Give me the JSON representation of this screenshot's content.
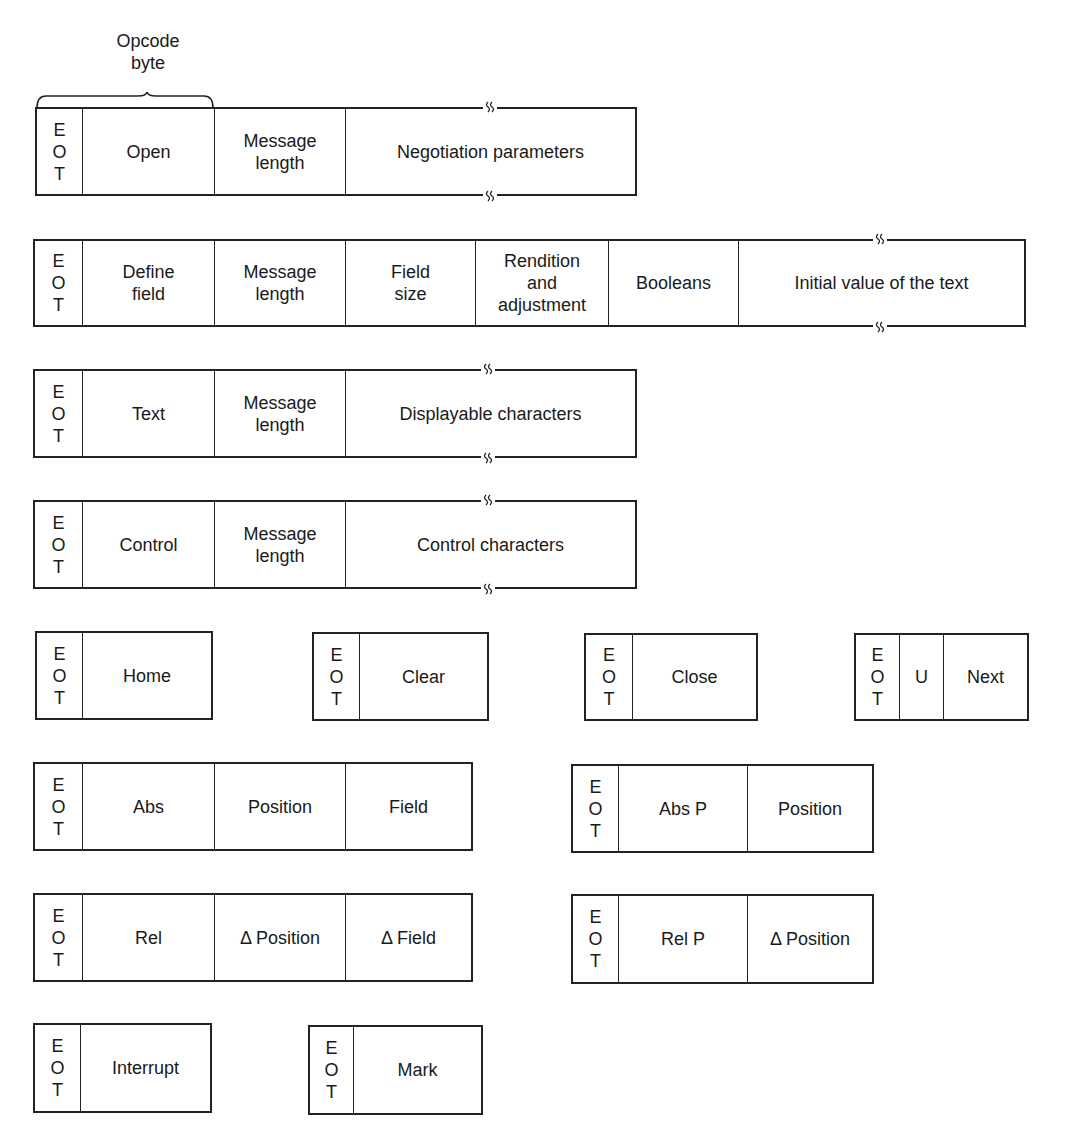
{
  "annotation": {
    "line1": "Opcode",
    "line2": "byte"
  },
  "eot": [
    "E",
    "O",
    "T"
  ],
  "messages": {
    "open": {
      "opcode": "Open",
      "fields": [
        "Message\nlength",
        "Negotiation parameters"
      ]
    },
    "define_field": {
      "opcode": "Define\nfield",
      "fields": [
        "Message\nlength",
        "Field\nsize",
        "Rendition\nand\nadjustment",
        "Booleans",
        "Initial value of the text"
      ]
    },
    "text": {
      "opcode": "Text",
      "fields": [
        "Message\nlength",
        "Displayable characters"
      ]
    },
    "control": {
      "opcode": "Control",
      "fields": [
        "Message\nlength",
        "Control characters"
      ]
    },
    "home": {
      "opcode": "Home"
    },
    "clear": {
      "opcode": "Clear"
    },
    "close": {
      "opcode": "Close"
    },
    "next": {
      "prefix": "U",
      "opcode": "Next"
    },
    "abs": {
      "opcode": "Abs",
      "fields": [
        "Position",
        "Field"
      ]
    },
    "abs_p": {
      "opcode": "Abs P",
      "fields": [
        "Position"
      ]
    },
    "rel": {
      "opcode": "Rel",
      "fields": [
        "Δ Position",
        "Δ Field"
      ]
    },
    "rel_p": {
      "opcode": "Rel P",
      "fields": [
        "Δ Position"
      ]
    },
    "interrupt": {
      "opcode": "Interrupt"
    },
    "mark": {
      "opcode": "Mark"
    }
  }
}
